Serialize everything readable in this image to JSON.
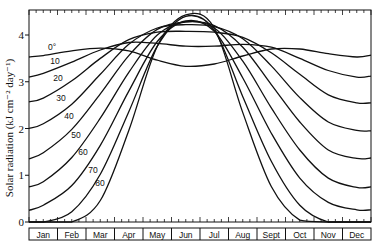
{
  "chart_data": {
    "type": "line",
    "title": "",
    "xlabel": "",
    "ylabel": "Solar radiation (kJ cm⁻² day⁻¹)",
    "ylim": [
      0,
      4.6
    ],
    "yticks": [
      0,
      1,
      2,
      3,
      4
    ],
    "grid": false,
    "legend": "inline curve labels (latitude in degrees)",
    "categories": [
      "Jan",
      "Feb",
      "Mar",
      "Apr",
      "May",
      "Jun",
      "Jul",
      "Aug",
      "Sept",
      "Oct",
      "Nov",
      "Dec"
    ],
    "series": [
      {
        "name": "0°",
        "label": "0°",
        "start": 3.53,
        "end": 3.57,
        "values": [
          3.56,
          3.66,
          3.72,
          3.66,
          3.46,
          3.33,
          3.38,
          3.55,
          3.7,
          3.7,
          3.6,
          3.53
        ]
      },
      {
        "name": "10",
        "label": "10",
        "start": 3.1,
        "end": 3.12,
        "values": [
          3.18,
          3.42,
          3.68,
          3.84,
          3.82,
          3.76,
          3.76,
          3.8,
          3.74,
          3.5,
          3.24,
          3.1
        ]
      },
      {
        "name": "20",
        "label": "20",
        "start": 2.57,
        "end": 2.55,
        "values": [
          2.65,
          3.02,
          3.5,
          3.9,
          4.06,
          4.08,
          4.06,
          3.95,
          3.62,
          3.16,
          2.72,
          2.55
        ]
      },
      {
        "name": "30",
        "label": "30",
        "start": 2.0,
        "end": 1.95,
        "values": [
          2.1,
          2.52,
          3.16,
          3.8,
          4.15,
          4.22,
          4.18,
          3.92,
          3.34,
          2.66,
          2.14,
          1.96
        ]
      },
      {
        "name": "40",
        "label": "40",
        "start": 1.35,
        "end": 1.37,
        "values": [
          1.48,
          1.98,
          2.74,
          3.56,
          4.12,
          4.28,
          4.2,
          3.74,
          2.94,
          2.14,
          1.54,
          1.36
        ]
      },
      {
        "name": "50",
        "label": "50",
        "start": 0.75,
        "end": 0.75,
        "values": [
          0.86,
          1.38,
          2.22,
          3.2,
          4.0,
          4.28,
          4.15,
          3.44,
          2.44,
          1.54,
          0.94,
          0.74
        ]
      },
      {
        "name": "60",
        "label": "60",
        "start": 0.25,
        "end": 0.26,
        "values": [
          0.36,
          0.78,
          1.64,
          2.8,
          3.86,
          4.3,
          4.08,
          3.08,
          1.9,
          0.94,
          0.42,
          0.26
        ]
      },
      {
        "name": "70",
        "label": "70",
        "start": 0.0,
        "end": 0.0,
        "values": [
          0.0,
          0.22,
          1.02,
          2.36,
          3.76,
          4.4,
          4.1,
          2.68,
          1.3,
          0.36,
          0.0,
          0.0
        ]
      },
      {
        "name": "80",
        "label": "80",
        "start": 0.0,
        "end": 0.0,
        "values": [
          0.0,
          0.0,
          0.46,
          1.96,
          3.76,
          4.43,
          4.15,
          2.34,
          0.76,
          0.04,
          0.0,
          0.0
        ]
      }
    ],
    "curve_label_positions": [
      {
        "label": "0°",
        "x": 52,
        "y": 47
      },
      {
        "label": "10",
        "x": 55,
        "y": 61
      },
      {
        "label": "20",
        "x": 58,
        "y": 78
      },
      {
        "label": "30",
        "x": 61,
        "y": 98
      },
      {
        "label": "40",
        "x": 69,
        "y": 116
      },
      {
        "label": "50",
        "x": 76,
        "y": 135
      },
      {
        "label": "60",
        "x": 83,
        "y": 152
      },
      {
        "label": "70",
        "x": 93,
        "y": 170
      },
      {
        "label": "80",
        "x": 100,
        "y": 183
      }
    ]
  }
}
